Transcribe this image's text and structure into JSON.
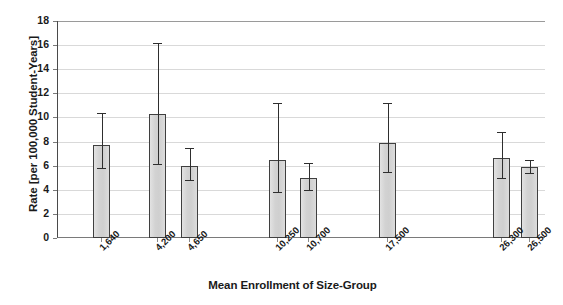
{
  "chart_data": {
    "type": "bar",
    "title": "",
    "xlabel": "Mean Enrollment of Size-Group",
    "ylabel": "Rate [per 100,000 Student-Years]",
    "categories": [
      "1,640",
      "4,200",
      "4,650",
      "10,250",
      "10,700",
      "17,500",
      "26,300",
      "26,500"
    ],
    "values": [
      7.7,
      10.3,
      6.0,
      6.5,
      5.0,
      7.9,
      6.6,
      5.9
    ],
    "error_high": [
      10.4,
      16.2,
      7.5,
      11.2,
      6.2,
      11.2,
      8.8,
      6.5
    ],
    "error_low": [
      5.8,
      6.1,
      4.8,
      3.8,
      4.0,
      5.5,
      5.0,
      5.4
    ],
    "ylim": [
      0,
      18
    ],
    "ytick_values": [
      "0",
      "2",
      "4",
      "6",
      "8",
      "10",
      "12",
      "14",
      "16",
      "18"
    ],
    "grid": true,
    "legend": "none",
    "bar_color": "#d5d5d5",
    "bar_edge_color": "#3f3f3f",
    "error_color": "#2e2e2e",
    "grid_color": "#d9d9d9"
  },
  "axis": {
    "y_title": "Rate [per 100,000 Student-Years]",
    "x_title": "Mean Enrollment of Size-Group"
  }
}
